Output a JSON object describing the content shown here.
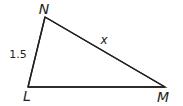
{
  "diagram": {
    "type": "triangle",
    "vertices": {
      "N": {
        "label": "N"
      },
      "L": {
        "label": "L"
      },
      "M": {
        "label": "M"
      }
    },
    "sides": {
      "LN": {
        "label": "1.5"
      },
      "NM": {
        "label": "x"
      },
      "LM": {
        "label": ""
      }
    },
    "colors": {
      "stroke": "#231f20",
      "background": "#ffffff"
    }
  }
}
